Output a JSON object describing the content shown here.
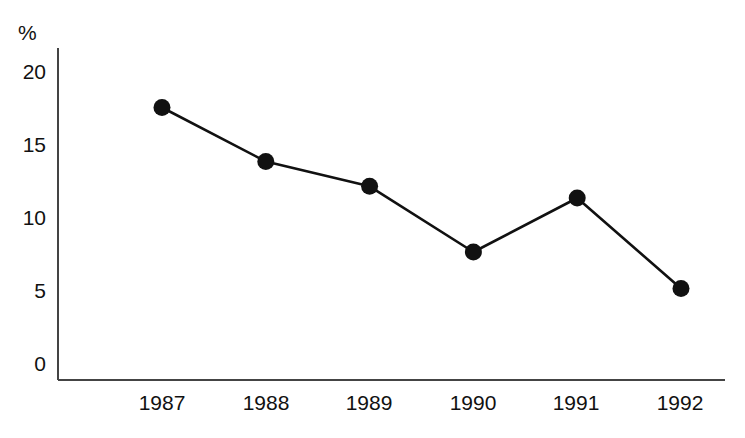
{
  "chart_data": {
    "type": "line",
    "title": "",
    "subtitle": "",
    "xlabel": "",
    "ylabel": "%",
    "unit_label": "%",
    "categories": [
      "1987",
      "1988",
      "1989",
      "1990",
      "1991",
      "1992"
    ],
    "x": [
      1987,
      1988,
      1989,
      1990,
      1991,
      1992
    ],
    "values": [
      17.5,
      13.8,
      12.1,
      7.6,
      11.3,
      5.1
    ],
    "series": [
      {
        "name": "",
        "values": [
          17.5,
          13.8,
          12.1,
          7.6,
          11.3,
          5.1
        ]
      }
    ],
    "ylim": [
      0,
      21.5
    ],
    "yticks": [
      0,
      5,
      10,
      15,
      20
    ],
    "ytick_labels": [
      "0",
      "5",
      "10",
      "15",
      "20"
    ],
    "xtick_labels": [
      "1987",
      "1988",
      "1989",
      "1990",
      "1991",
      "1992"
    ],
    "grid": false,
    "legend": false,
    "legend_position": "none",
    "marker": "filled-circle",
    "line_color": "#111111",
    "marker_color": "#111111",
    "axis_color": "#444444",
    "background_color": "#ffffff",
    "annotations": []
  },
  "axes": {
    "y_unit": "%",
    "y_ticks": [
      {
        "label": "20",
        "value": 20
      },
      {
        "label": "15",
        "value": 15
      },
      {
        "label": "10",
        "value": 10
      },
      {
        "label": "5",
        "value": 5
      },
      {
        "label": "0",
        "value": 0
      }
    ],
    "x_ticks": [
      {
        "label": "1987"
      },
      {
        "label": "1988"
      },
      {
        "label": "1989"
      },
      {
        "label": "1990"
      },
      {
        "label": "1991"
      },
      {
        "label": "1992"
      }
    ]
  }
}
